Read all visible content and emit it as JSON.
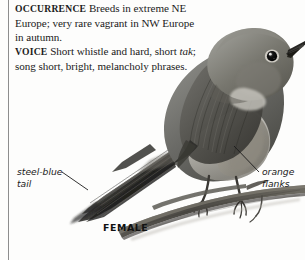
{
  "page": {
    "kind": "field-guide-species-entry",
    "background_color": "#fdfdfc",
    "rule_color": "#8d8d8d"
  },
  "text_block": {
    "occurrence": {
      "heading": "OCCURRENCE",
      "body": "Breeds in extreme NE Europe; very rare vagrant in NW Europe in autumn."
    },
    "voice": {
      "heading": "VOICE",
      "body_before_italic": "Short whistle and hard, short ",
      "italic_term": "tak",
      "body_after_italic": "; song short, bright, melancholy phrases."
    }
  },
  "callouts": [
    {
      "id": "steel-blue-tail",
      "label": "steel-blue\ntail",
      "line1": "steel-blue",
      "line2": "tail"
    },
    {
      "id": "orange-flanks",
      "label": "orange\nflanks",
      "line1": "orange",
      "line2": "flanks"
    }
  ],
  "caption": {
    "label": "FEMALE"
  },
  "illustration": {
    "subject": "perched-songbird",
    "palette": {
      "plumage_dark": "#4a4a48",
      "plumage_mid": "#6e6e6a",
      "plumage_light": "#9a9a95",
      "underpart": "#cfcdc7",
      "tail_dark": "#2a2a2a",
      "bill": "#1c1c1c",
      "eye": "#101010",
      "eyering": "#e7e5e0",
      "branch": "#55534e"
    }
  }
}
